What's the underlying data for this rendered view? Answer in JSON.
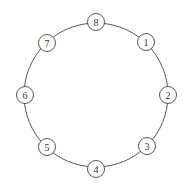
{
  "diagram": {
    "type": "ring",
    "center": {
      "x": 96,
      "y": 95
    },
    "ring_radius": 72,
    "node_radius": 8.5,
    "stroke_color": "#444444",
    "fill_color": "#ffffff",
    "text_color": "#333333",
    "nodes": [
      {
        "label": "1",
        "x": 146,
        "y": 42
      },
      {
        "label": "2",
        "x": 168,
        "y": 95
      },
      {
        "label": "3",
        "x": 147,
        "y": 146
      },
      {
        "label": "4",
        "x": 96,
        "y": 169
      },
      {
        "label": "5",
        "x": 47,
        "y": 147
      },
      {
        "label": "6",
        "x": 25,
        "y": 95
      },
      {
        "label": "7",
        "x": 47,
        "y": 43
      },
      {
        "label": "8",
        "x": 96,
        "y": 22
      }
    ]
  }
}
